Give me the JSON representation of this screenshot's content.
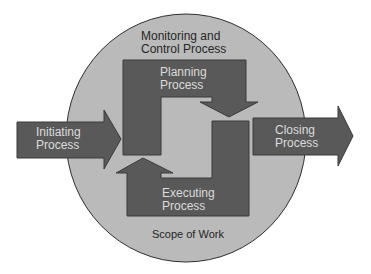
{
  "diagram": {
    "colors": {
      "circle_fill": "#bababa",
      "circle_stroke": "#2e2e2e",
      "shape_fill": "#595959",
      "shape_stroke": "#3a3a3a",
      "dark_text": "#262626",
      "light_text": "#dcdcdc"
    },
    "circle": {
      "label": "Scope of Work"
    },
    "monitoring": {
      "line1": "Monitoring and",
      "line2": "Control Process"
    },
    "initiating": {
      "line1": "Initiating",
      "line2": "Process"
    },
    "planning": {
      "line1": "Planning",
      "line2": "Process"
    },
    "executing": {
      "line1": "Executing",
      "line2": "Process"
    },
    "closing": {
      "line1": "Closing",
      "line2": "Process"
    }
  }
}
